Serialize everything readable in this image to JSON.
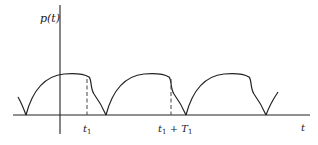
{
  "diagram": {
    "y_axis_label": "p(t)",
    "x_axis_label": "t",
    "markers": [
      {
        "name": "t1",
        "base": "t",
        "subscript": "1",
        "suffix": ""
      },
      {
        "name": "t1-plus-T1",
        "base": "t",
        "subscript": "1",
        "suffix": " + T",
        "suffix_subscript": "1"
      }
    ],
    "waveform": {
      "shape": "repeating arch with dicrotic notch",
      "period_label": "T1",
      "visible_cycles": 3
    },
    "colors": {
      "line": "#222222",
      "dash": "#444444",
      "background": "#ffffff"
    }
  }
}
